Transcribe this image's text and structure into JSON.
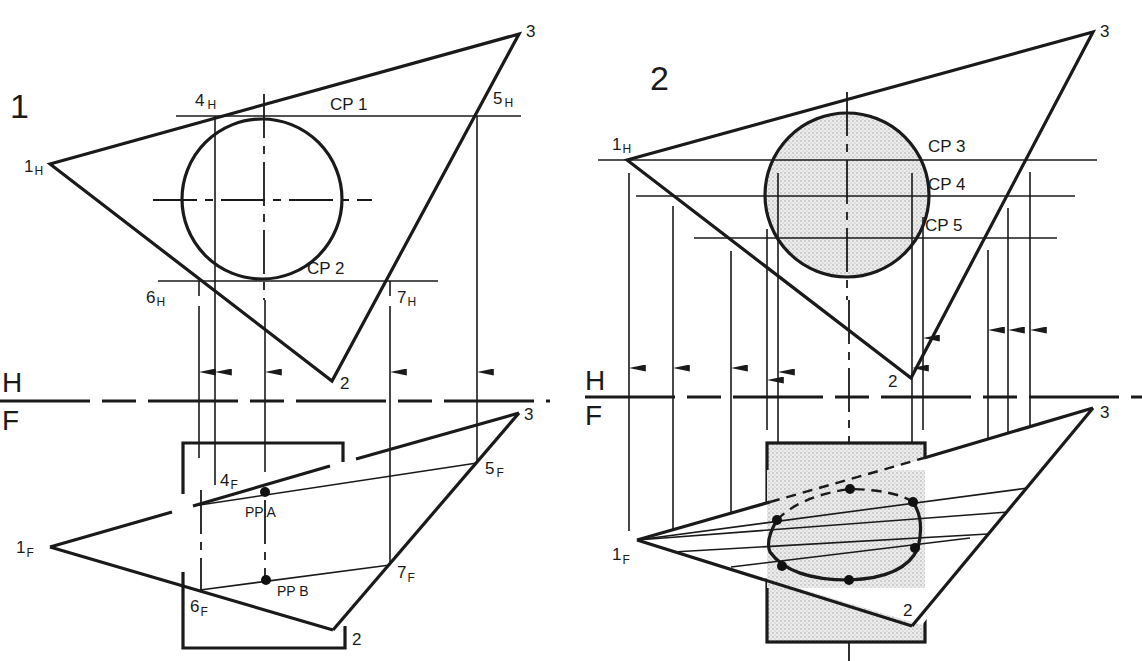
{
  "figure1": {
    "number": "1",
    "cutting_planes": [
      "CP 1",
      "CP 2"
    ],
    "points_H": {
      "p1": "1",
      "p1_sub": "H",
      "p2": "2",
      "p3": "3",
      "p4": "4",
      "p4_sub": "H",
      "p5": "5",
      "p5_sub": "H",
      "p6": "6",
      "p6_sub": "H",
      "p7": "7",
      "p7_sub": "H"
    },
    "points_F": {
      "p1": "1",
      "p1_sub": "F",
      "p2": "2",
      "p3": "3",
      "p4": "4",
      "p4_sub": "F",
      "p5": "5",
      "p5_sub": "F",
      "p6": "6",
      "p6_sub": "F",
      "p7": "7",
      "p7_sub": "F"
    },
    "piercing_points": [
      "PP A",
      "PP B"
    ]
  },
  "figure2": {
    "number": "2",
    "cutting_planes": [
      "CP 3",
      "CP 4",
      "CP 5"
    ],
    "points_H": {
      "p1": "1",
      "p1_sub": "H",
      "p2": "2",
      "p3": "3"
    },
    "points_F": {
      "p1": "1",
      "p1_sub": "F",
      "p2": "2",
      "p3": "3"
    }
  },
  "reference_line": {
    "top": "H",
    "bottom": "F"
  },
  "colors": {
    "ink": "#1a1a1a",
    "shade": "#e4e4e4",
    "paper": "#ffffff"
  }
}
